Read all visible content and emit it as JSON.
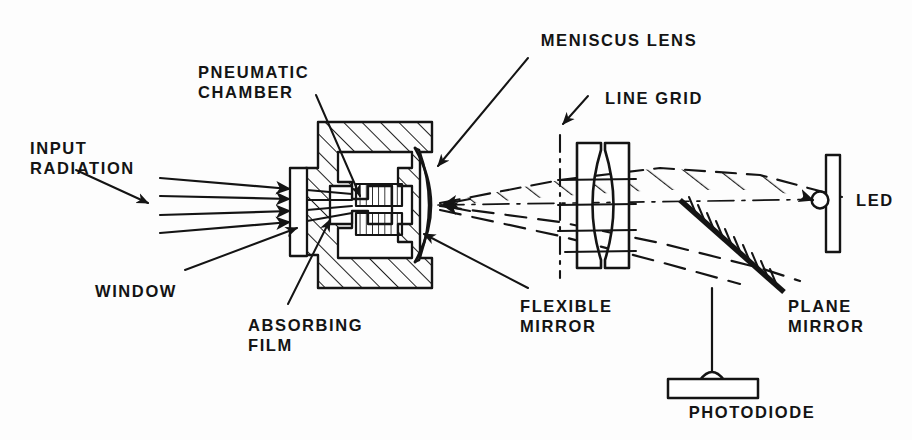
{
  "figure": {
    "kind": "optical-pneumatic-detector-schematic",
    "background_color": "#fdfdfd",
    "ink_color": "#141414"
  },
  "labels": {
    "meniscus_lens": "MENISCUS LENS",
    "pneumatic_chamber": "PNEUMATIC\nCHAMBER",
    "line_grid": "LINE GRID",
    "input_radiation": "INPUT\nRADIATION",
    "led": "LED",
    "window": "WINDOW",
    "absorbing_film": "ABSORBING\nFILM",
    "flexible_mirror": "FLEXIBLE\nMIRROR",
    "plane_mirror": "PLANE\nMIRROR",
    "photodiode": "PHOTODIODE"
  },
  "label_positions": {
    "meniscus_lens": {
      "x": 619,
      "y": 30,
      "align": "ctr"
    },
    "pneumatic_chamber": {
      "x": 265,
      "y": 62,
      "align": "ctr"
    },
    "line_grid": {
      "x": 654,
      "y": 80,
      "align": "ctr"
    },
    "input_radiation": {
      "x": 30,
      "y": 138,
      "align": "lft"
    },
    "led": {
      "x": 856,
      "y": 192,
      "align": "lft"
    },
    "window": {
      "x": 95,
      "y": 281,
      "align": "lft"
    },
    "absorbing_film": {
      "x": 250,
      "y": 315,
      "align": "lft"
    },
    "flexible_mirror": {
      "x": 520,
      "y": 296,
      "align": "lft"
    },
    "plane_mirror": {
      "x": 788,
      "y": 296,
      "align": "lft"
    },
    "photodiode": {
      "x": 752,
      "y": 400,
      "align": "ctr"
    }
  },
  "components": [
    {
      "name": "pneumatic-chamber-body",
      "description": "hatched cross-section housing block"
    },
    {
      "name": "window",
      "description": "small rectangular entrance window on left face"
    },
    {
      "name": "absorbing-film",
      "description": "two vertically hatched film blocks inside chamber"
    },
    {
      "name": "flexible-mirror",
      "description": "curved crescent membrane on chamber right face"
    },
    {
      "name": "meniscus-lens",
      "description": "curved lens element at chamber right"
    },
    {
      "name": "line-grid",
      "description": "dash-dot vertical reticle line left of lens pair"
    },
    {
      "name": "lens-pair",
      "description": "two plano-concave lens elements"
    },
    {
      "name": "plane-mirror",
      "description": "thick diagonal mirror with back hatching"
    },
    {
      "name": "led",
      "description": "small circle source against vertical bar mount"
    },
    {
      "name": "photodiode",
      "description": "rectangular base with dome detector"
    },
    {
      "name": "input-radiation-rays",
      "description": "four parallel converging arrows from left"
    },
    {
      "name": "beam-envelope",
      "description": "hatched cone of light between lens and mirror"
    }
  ]
}
